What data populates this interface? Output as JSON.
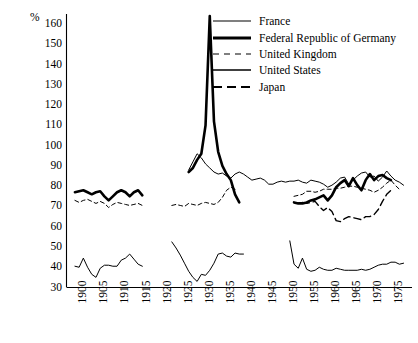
{
  "chart_data": {
    "type": "line",
    "title": "",
    "subtitle": "",
    "xlabel": "",
    "ylabel": "%",
    "unit_label": "%",
    "grid": false,
    "legend_position": "top-right",
    "xlim": [
      1896,
      1978
    ],
    "ylim": [
      30,
      165
    ],
    "yticks": [
      30,
      40,
      50,
      60,
      70,
      80,
      90,
      100,
      110,
      120,
      130,
      140,
      150,
      160
    ],
    "ytick_labels": [
      "30",
      "40",
      "50",
      "60",
      "70",
      "80",
      "90",
      "100",
      "110",
      "120",
      "130",
      "140",
      "150",
      "160"
    ],
    "xticks": [
      1900,
      1905,
      1910,
      1915,
      1920,
      1925,
      1930,
      1935,
      1940,
      1945,
      1950,
      1955,
      1960,
      1965,
      1970,
      1975
    ],
    "xtick_labels": [
      "1900",
      "1905",
      "1910",
      "1915",
      "1920",
      "1925",
      "1930",
      "1935",
      "1940",
      "1945",
      "1950",
      "1955",
      "1960",
      "1965",
      "1970",
      "1975"
    ],
    "series": [
      {
        "name": "France",
        "style": "thin-solid",
        "color": "#000000",
        "width": 1.0,
        "dash": "none",
        "segments": [
          {
            "x": [
              1898,
              1899,
              1900,
              1901,
              1902,
              1903,
              1904,
              1905,
              1906,
              1907,
              1908,
              1909,
              1910,
              1911,
              1912,
              1913,
              1914
            ],
            "y": [
              40.5,
              40.0,
              44.5,
              40.0,
              36.5,
              35.0,
              39.5,
              41.0,
              41.0,
              40.5,
              40.5,
              43.5,
              44.5,
              46.5,
              44.0,
              41.5,
              40.5
            ]
          },
          {
            "x": [
              1921,
              1922,
              1923,
              1924,
              1925,
              1926,
              1927,
              1928,
              1929,
              1930,
              1931,
              1932,
              1933,
              1934,
              1935,
              1936,
              1937,
              1938
            ],
            "y": [
              52.5,
              49.5,
              46.0,
              42.0,
              38.0,
              35.0,
              33.0,
              36.5,
              36.0,
              38.5,
              42.0,
              46.5,
              47.0,
              45.5,
              45.0,
              47.0,
              46.5,
              46.5
            ]
          },
          {
            "x": [
              1949,
              1950,
              1951,
              1952,
              1953,
              1954,
              1955,
              1956,
              1957,
              1958,
              1959,
              1960,
              1961,
              1962,
              1963,
              1964,
              1965,
              1966,
              1967,
              1968,
              1969,
              1970,
              1971,
              1972,
              1973,
              1974,
              1975,
              1976
            ],
            "y": [
              53.0,
              41.5,
              39.5,
              44.5,
              39.0,
              38.0,
              38.5,
              40.0,
              39.0,
              38.5,
              38.5,
              39.5,
              39.0,
              38.5,
              38.5,
              38.5,
              38.5,
              39.0,
              38.5,
              39.0,
              40.0,
              41.0,
              41.5,
              41.5,
              42.5,
              42.5,
              41.5,
              42.0
            ]
          }
        ]
      },
      {
        "name": "Federal Republic of Germany",
        "style": "thick-solid",
        "color": "#000000",
        "width": 2.6,
        "dash": "none",
        "segments": [
          {
            "x": [
              1898,
              1899,
              1900,
              1901,
              1902,
              1903,
              1904,
              1905,
              1906,
              1907,
              1908,
              1909,
              1910,
              1911,
              1912,
              1913,
              1914
            ],
            "y": [
              77.0,
              77.5,
              78.0,
              77.0,
              76.0,
              77.0,
              77.5,
              75.0,
              73.0,
              75.0,
              77.0,
              78.0,
              77.0,
              75.0,
              77.0,
              78.0,
              75.5
            ]
          },
          {
            "x": [
              1925,
              1926,
              1927,
              1928,
              1929,
              1930,
              1931,
              1932,
              1933,
              1934,
              1935,
              1936,
              1937
            ],
            "y": [
              87.0,
              89.0,
              93.0,
              96.0,
              110.0,
              164.0,
              112.0,
              97.0,
              90.0,
              86.0,
              83.0,
              76.0,
              72.0
            ]
          },
          {
            "x": [
              1950,
              1951,
              1952,
              1953,
              1954,
              1955,
              1956,
              1957,
              1958,
              1959,
              1960,
              1961,
              1962,
              1963,
              1964,
              1965,
              1966,
              1967,
              1968,
              1969,
              1970,
              1971,
              1972,
              1973
            ],
            "y": [
              72.0,
              71.5,
              71.5,
              72.0,
              73.0,
              73.5,
              74.5,
              75.5,
              73.0,
              75.5,
              79.5,
              81.5,
              83.0,
              80.0,
              84.0,
              80.5,
              78.0,
              83.0,
              86.0,
              83.0,
              85.0,
              85.5,
              84.0,
              83.0
            ]
          }
        ]
      },
      {
        "name": "United Kingdom",
        "style": "short-dash",
        "color": "#000000",
        "width": 1.0,
        "dash": "4,3",
        "segments": [
          {
            "x": [
              1898,
              1899,
              1900,
              1901,
              1902,
              1903,
              1904,
              1905,
              1906,
              1907,
              1908,
              1909,
              1910,
              1911,
              1912,
              1913,
              1914
            ],
            "y": [
              73.0,
              72.0,
              73.0,
              73.5,
              72.5,
              71.5,
              72.5,
              71.5,
              69.5,
              71.0,
              72.0,
              71.5,
              71.0,
              70.5,
              71.0,
              71.5,
              70.5
            ]
          },
          {
            "x": [
              1921,
              1922,
              1923,
              1924,
              1925,
              1926,
              1927,
              1928,
              1929,
              1930,
              1931,
              1932,
              1933,
              1934,
              1935,
              1936
            ],
            "y": [
              70.5,
              71.0,
              70.5,
              70.0,
              71.5,
              71.0,
              70.5,
              71.5,
              72.0,
              71.5,
              71.0,
              72.0,
              74.5,
              78.0,
              79.5,
              78.5
            ]
          },
          {
            "x": [
              1950,
              1951,
              1952,
              1953,
              1954,
              1955,
              1956,
              1957,
              1958,
              1959,
              1960,
              1961,
              1962,
              1963,
              1964,
              1965,
              1966,
              1967,
              1968,
              1969,
              1970,
              1971,
              1972,
              1973,
              1974,
              1975
            ],
            "y": [
              75.0,
              75.5,
              76.0,
              77.5,
              77.5,
              77.0,
              77.5,
              78.5,
              78.5,
              78.5,
              79.0,
              79.0,
              79.5,
              80.0,
              80.0,
              79.5,
              79.0,
              78.5,
              78.0,
              77.0,
              78.0,
              79.5,
              81.5,
              83.0,
              80.5,
              78.5
            ]
          }
        ]
      },
      {
        "name": "United States",
        "style": "thin-solid",
        "color": "#000000",
        "width": 1.0,
        "dash": "none",
        "segments": [
          {
            "x": [
              1925,
              1926,
              1927,
              1928,
              1929,
              1930,
              1931,
              1932,
              1933,
              1934,
              1935,
              1936,
              1937,
              1938,
              1939,
              1940,
              1941,
              1942,
              1943,
              1944,
              1945,
              1946,
              1947,
              1948,
              1949,
              1950,
              1951,
              1952,
              1953,
              1954,
              1955,
              1956,
              1957,
              1958,
              1959,
              1960,
              1961,
              1962,
              1963,
              1964,
              1965,
              1966,
              1967,
              1968,
              1969,
              1970,
              1971,
              1972,
              1973,
              1974,
              1975,
              1976
            ],
            "y": [
              88.0,
              92.0,
              96.0,
              94.0,
              91.0,
              89.0,
              87.0,
              86.0,
              86.5,
              85.0,
              84.0,
              86.0,
              87.0,
              86.0,
              84.5,
              83.0,
              83.5,
              84.0,
              83.0,
              81.0,
              81.0,
              82.0,
              82.5,
              82.0,
              82.5,
              82.5,
              83.0,
              82.0,
              81.5,
              83.0,
              82.5,
              82.0,
              81.0,
              79.5,
              80.5,
              82.0,
              84.0,
              84.5,
              81.0,
              83.0,
              85.0,
              86.5,
              87.0,
              84.5,
              85.0,
              82.5,
              84.5,
              87.5,
              85.0,
              83.0,
              82.0,
              80.5
            ]
          }
        ]
      },
      {
        "name": "Japan",
        "style": "long-dash",
        "color": "#000000",
        "width": 1.4,
        "dash": "7,4",
        "segments": [
          {
            "x": [
              1952,
              1953,
              1954,
              1955,
              1956,
              1957,
              1958,
              1959,
              1960,
              1961,
              1962,
              1963,
              1964,
              1965,
              1966,
              1967,
              1968,
              1969,
              1970,
              1971,
              1972,
              1973
            ],
            "y": [
              72.0,
              71.5,
              72.0,
              72.5,
              70.0,
              68.0,
              69.5,
              67.5,
              63.0,
              62.5,
              64.0,
              65.0,
              64.5,
              64.0,
              63.5,
              65.0,
              65.0,
              66.0,
              68.5,
              72.5,
              76.0,
              78.0
            ]
          }
        ]
      }
    ]
  },
  "axis": {
    "unit": "%"
  },
  "legend": {
    "entries": [
      {
        "label": "France",
        "key": "legend-key-thin-solid"
      },
      {
        "label": "Federal Republic of Germany",
        "key": "legend-key-thick-solid"
      },
      {
        "label": "United Kingdom",
        "key": "legend-key-short-dash"
      },
      {
        "label": "United States",
        "key": "legend-key-thin-solid"
      },
      {
        "label": "Japan",
        "key": "legend-key-long-dash"
      }
    ]
  }
}
